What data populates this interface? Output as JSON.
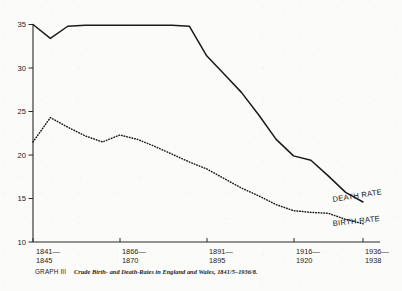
{
  "figure": {
    "graph_tag": "GRAPH III",
    "caption": "Crude Birth- and Death-Rates in England and Wales, 1841/5–1936/8."
  },
  "labels": {
    "death_rate": "DEATH RATE",
    "birth_rate": "BIRTH RATE"
  },
  "colors": {
    "ink": "#1a1a19",
    "paper": "#fbfbfa",
    "axis": "#2a2a28"
  },
  "chart_data": {
    "type": "line",
    "title": "Crude Birth- and Death-Rates in England and Wales, 1841/5–1936/8.",
    "xlabel": "",
    "ylabel": "",
    "ylim": [
      10,
      35
    ],
    "yticks": [
      10,
      15,
      20,
      25,
      30,
      35
    ],
    "ytick_labels": [
      "10",
      "15",
      "20",
      "25",
      "30",
      "35"
    ],
    "grid": false,
    "legend": "inline-end-labels",
    "x_tick_groups": [
      {
        "top": "1841—",
        "bottom": "1845"
      },
      {
        "top": "1866—",
        "bottom": "1870"
      },
      {
        "top": "1891—",
        "bottom": "1895"
      },
      {
        "top": "1916—",
        "bottom": "1920"
      },
      {
        "top": "1936—",
        "bottom": "1938"
      }
    ],
    "x": [
      "1841/5",
      "1846/50",
      "1851/5",
      "1856/60",
      "1861/5",
      "1866/70",
      "1871/5",
      "1876/80",
      "1881/5",
      "1886/90",
      "1891/5",
      "1896/1900",
      "1901/5",
      "1906/10",
      "1911/5",
      "1916/20",
      "1921/5",
      "1926/30",
      "1931/5",
      "1936/8"
    ],
    "series": [
      {
        "name": "DEATH RATE",
        "style": "solid",
        "values": [
          35.0,
          33.4,
          34.8,
          34.9,
          34.9,
          34.9,
          34.9,
          34.9,
          34.9,
          34.8,
          31.4,
          29.3,
          27.2,
          24.6,
          21.8,
          19.9,
          19.4,
          17.6,
          15.7,
          14.6
        ]
      },
      {
        "name": "BIRTH RATE",
        "style": "dotted",
        "values": [
          21.5,
          24.3,
          23.2,
          22.2,
          21.5,
          22.3,
          21.8,
          21.0,
          20.1,
          19.2,
          18.4,
          17.3,
          16.2,
          15.3,
          14.3,
          13.6,
          13.4,
          13.3,
          12.6,
          12.1
        ]
      }
    ]
  }
}
